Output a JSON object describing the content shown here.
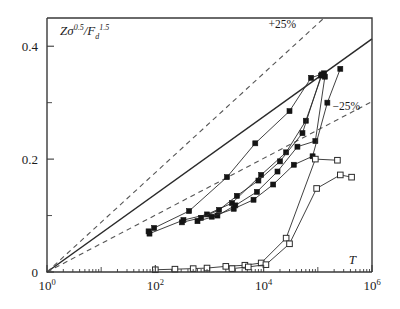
{
  "figure": {
    "background": "#ffffff",
    "frame_color": "#3a3a3a"
  },
  "axes": {
    "y_label": "Zσ",
    "y_label_sup1": "0.5",
    "y_label_mid": "/F",
    "y_label_sub": "d",
    "y_label_sup2": "1.5",
    "x_label": "T",
    "y_ticks": [
      "0",
      "0.2",
      "0.4"
    ],
    "x_tick_mantissa": "10",
    "x_tick_exponents": [
      "0",
      "2",
      "4",
      "6"
    ],
    "x_ticks_label": [
      "10^0",
      "10^2",
      "10^4",
      "10^6"
    ]
  },
  "annotations": {
    "upper": "+25%",
    "lower": "−25%"
  },
  "chart_data": {
    "type": "scatter",
    "title": "",
    "xlabel": "T",
    "ylabel": "Zσ^0.5/F_d^1.5",
    "xscale": "log",
    "yscale": "linear",
    "xlim": [
      1,
      1000000
    ],
    "ylim": [
      0,
      0.45
    ],
    "grid": false,
    "legend": "none",
    "reference_lines": [
      {
        "name": "perfect-agreement",
        "style": "solid",
        "label": "",
        "points": [
          [
            1,
            0.0
          ],
          [
            1000000,
            0.413
          ]
        ]
      },
      {
        "name": "plus-25-percent",
        "style": "dashed",
        "label": "+25%",
        "points": [
          [
            1,
            0.0
          ],
          [
            130000,
            0.45
          ]
        ]
      },
      {
        "name": "minus-25-percent",
        "style": "dashed",
        "label": "−25%",
        "points": [
          [
            1,
            0.0
          ],
          [
            1000000,
            0.302
          ]
        ]
      }
    ],
    "series": [
      {
        "name": "filled-series-1",
        "marker": "filled-square",
        "x": [
          75,
          95,
          420,
          2100,
          7000,
          30000,
          75000,
          130000
        ],
        "y": [
          0.072,
          0.078,
          0.108,
          0.168,
          0.228,
          0.285,
          0.344,
          0.352
        ]
      },
      {
        "name": "filled-series-2",
        "marker": "filled-square",
        "x": [
          78,
          330,
          900,
          2600,
          9000,
          26000,
          60000,
          120000
        ],
        "y": [
          0.068,
          0.092,
          0.102,
          0.122,
          0.172,
          0.212,
          0.268,
          0.35
        ]
      },
      {
        "name": "filled-series-3",
        "marker": "filled-square",
        "x": [
          310,
          700,
          1500,
          3200,
          8000,
          20000,
          52000,
          115000
        ],
        "y": [
          0.088,
          0.096,
          0.11,
          0.135,
          0.162,
          0.196,
          0.246,
          0.348
        ]
      },
      {
        "name": "filled-series-4",
        "marker": "filled-square",
        "x": [
          600,
          1400,
          3000,
          7500,
          18000,
          42000,
          90000,
          135000
        ],
        "y": [
          0.09,
          0.1,
          0.118,
          0.142,
          0.178,
          0.222,
          0.232,
          0.346
        ]
      },
      {
        "name": "filled-series-5",
        "marker": "filled-square",
        "x": [
          1100,
          2800,
          6500,
          15000,
          36000,
          80000,
          150000,
          260000
        ],
        "y": [
          0.098,
          0.112,
          0.128,
          0.155,
          0.19,
          0.205,
          0.3,
          0.36
        ]
      },
      {
        "name": "open-series-1",
        "marker": "open-square",
        "x": [
          100,
          230,
          500,
          900,
          2000,
          4500,
          9000,
          26000,
          90000,
          230000
        ],
        "y": [
          0.004,
          0.005,
          0.006,
          0.007,
          0.01,
          0.012,
          0.016,
          0.06,
          0.2,
          0.198
        ]
      },
      {
        "name": "open-series-2",
        "marker": "open-square",
        "x": [
          2600,
          5200,
          11000,
          30000,
          95000,
          260000,
          420000
        ],
        "y": [
          0.006,
          0.009,
          0.013,
          0.05,
          0.148,
          0.172,
          0.168
        ]
      }
    ]
  }
}
